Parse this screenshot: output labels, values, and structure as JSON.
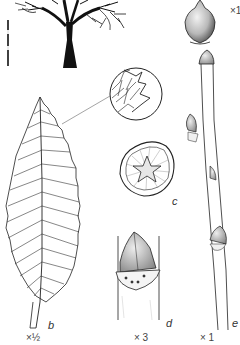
{
  "figure": {
    "type": "botanical-plate",
    "panels": [
      {
        "id": "a",
        "name": "tree-silhouette",
        "label": "",
        "scale": ""
      },
      {
        "id": "fruit",
        "name": "nut",
        "label": "",
        "scale": "×1"
      },
      {
        "id": "margin",
        "name": "leaf-margin-detail",
        "label": "",
        "scale": ""
      },
      {
        "id": "b",
        "name": "leaf",
        "label": "b",
        "scale": "×½"
      },
      {
        "id": "c",
        "name": "twig-cross-section",
        "label": "c",
        "scale": ""
      },
      {
        "id": "d",
        "name": "bud-detail",
        "label": "d",
        "scale": "× 3"
      },
      {
        "id": "e",
        "name": "twig",
        "label": "e",
        "scale": "× 1"
      }
    ]
  },
  "labels": {
    "fruit_scale": "×1",
    "leaf_letter": "b",
    "leaf_scale": "×½",
    "section_letter": "c",
    "bud_letter": "d",
    "bud_scale": "× 3",
    "twig_letter": "e",
    "twig_scale": "× 1"
  },
  "colors": {
    "ink": "#1a1a1a",
    "shade": "#bdbdbd",
    "paper": "#ffffff"
  }
}
